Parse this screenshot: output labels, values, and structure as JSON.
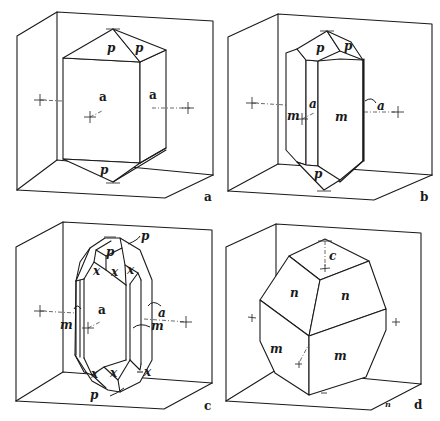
{
  "figure": {
    "panels": [
      {
        "id": "a",
        "label": "a",
        "faces": [
          "p",
          "p",
          "a",
          "a",
          "p"
        ],
        "face_labels": {
          "top_left": "p",
          "top_right": "p",
          "front": "a",
          "side": "a",
          "bottom": "p"
        }
      },
      {
        "id": "b",
        "label": "b",
        "face_labels": {
          "top_left": "p",
          "top_right": "p",
          "front_narrow": "a",
          "left": "m",
          "front_wide": "m",
          "side_pointer": "a",
          "bottom": "p"
        }
      },
      {
        "id": "c",
        "label": "c",
        "face_labels": {
          "top_p_pointer": "p",
          "top_p": "p",
          "x1": "x",
          "x2": "x",
          "x3": "x",
          "front": "a",
          "left_m_pointer": "m",
          "side_a_pointer": "a",
          "right_m_pointer": "m",
          "bx1": "x",
          "bx2": "x",
          "bx3": "x",
          "bottom_p_pointer": "p"
        }
      },
      {
        "id": "d",
        "label": "d",
        "face_labels": {
          "top_axis": "c",
          "upper_left": "n",
          "upper_right": "n",
          "lower_left": "m",
          "lower_right": "m"
        },
        "corner_mark": "n"
      }
    ]
  }
}
